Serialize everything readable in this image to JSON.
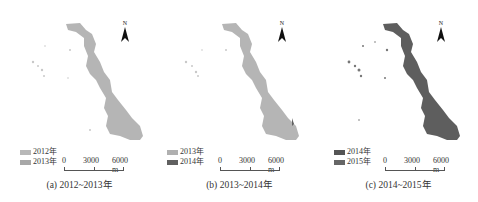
{
  "panels": [
    {
      "caption": "(a) 2012~2013年",
      "legend": [
        {
          "label": "2012年",
          "color": "#b8b8b8"
        },
        {
          "label": "2013年",
          "color": "#a8a8a8"
        }
      ],
      "main_color": "#b0b0b0",
      "north_label": "N",
      "scale": {
        "labels": [
          "0",
          "3000",
          "6000 m"
        ]
      }
    },
    {
      "caption": "(b) 2013~2014年",
      "legend": [
        {
          "label": "2013年",
          "color": "#b0b0b0"
        },
        {
          "label": "2014年",
          "color": "#606060"
        }
      ],
      "main_color": "#b0b0b0",
      "north_label": "N",
      "scale": {
        "labels": [
          "0",
          "3000",
          "6000 m"
        ]
      }
    },
    {
      "caption": "(c) 2014~2015年",
      "legend": [
        {
          "label": "2014年",
          "color": "#555555"
        },
        {
          "label": "2015年",
          "color": "#666666"
        }
      ],
      "main_color": "#5e5e5e",
      "north_label": "N",
      "scale": {
        "labels": [
          "0",
          "3000",
          "6000 m"
        ]
      }
    }
  ]
}
